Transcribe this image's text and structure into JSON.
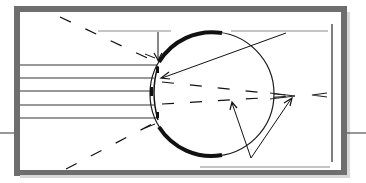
{
  "diagram": {
    "type": "eye-optics-diagram",
    "labels": [],
    "colors": {
      "frame": "#6e6e6e",
      "line": "#1a1a1a",
      "guide": "#8a8a8a",
      "background": "#ffffff"
    },
    "parts": {
      "frame": "outer-frame",
      "eyeball": "eyeball-circle",
      "cornea": "cornea-arc",
      "sclera_top": "sclera-top-band",
      "sclera_bottom": "sclera-bottom-band",
      "iris_top": "iris-top",
      "iris_bottom": "iris-bottom",
      "lens": "lens",
      "parallel_rays": 5,
      "dashed_rays": 4,
      "pointer_arrows": 4
    }
  }
}
